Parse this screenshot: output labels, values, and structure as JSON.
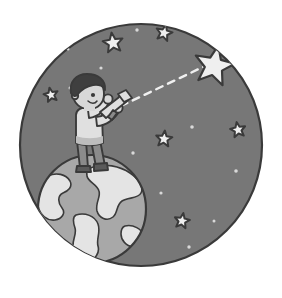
{
  "illustration": {
    "title": "Boy with telescope standing on Earth looking at a star",
    "canvas": {
      "width": 282,
      "height": 298,
      "background": "#ffffff"
    },
    "night_sky": {
      "name": "night-sky-circle",
      "cx": 141,
      "cy": 145,
      "r": 121,
      "fill": "#777777",
      "stroke": "#3a3a3a",
      "stroke_width": 2.2
    },
    "earth": {
      "name": "earth-globe",
      "cx": 92,
      "cy": 209,
      "r": 54,
      "ocean_fill": "#a8a8a8",
      "land_fill": "#e4e4e4",
      "stroke": "#3a3a3a",
      "stroke_width": 2.2
    },
    "sight_line": {
      "name": "telescope-sight-line",
      "x1": 121,
      "y1": 106,
      "x2": 205,
      "y2": 66,
      "color": "#f0f0f0",
      "dash": "7 6",
      "width": 2.4
    },
    "hero_star": {
      "name": "hero-star",
      "cx": 214,
      "cy": 66,
      "r": 21,
      "fill": "#efefef",
      "stroke": "#3a3a3a",
      "stroke_width": 2.2,
      "rotation": 12
    },
    "stars": [
      {
        "name": "star-top-left",
        "cx": 113,
        "cy": 43,
        "r": 10.5,
        "rot": -8
      },
      {
        "name": "star-top-right",
        "cx": 164,
        "cy": 33,
        "r": 8.5,
        "rot": 14
      },
      {
        "name": "star-left",
        "cx": 51,
        "cy": 95,
        "r": 7.5,
        "rot": -12
      },
      {
        "name": "star-center",
        "cx": 164,
        "cy": 139,
        "r": 8.5,
        "rot": 6
      },
      {
        "name": "star-right",
        "cx": 238,
        "cy": 130,
        "r": 8.0,
        "rot": -10
      },
      {
        "name": "star-bottom",
        "cx": 182,
        "cy": 221,
        "r": 8.0,
        "rot": 10
      }
    ],
    "star_style": {
      "fill": "#efefef",
      "stroke": "#3a3a3a",
      "stroke_width": 2.0
    },
    "sparkles": [
      {
        "name": "sparkle-1",
        "cx": 137,
        "cy": 30,
        "r": 1.7
      },
      {
        "name": "sparkle-2",
        "cx": 101,
        "cy": 68,
        "r": 1.6
      },
      {
        "name": "sparkle-3",
        "cx": 70,
        "cy": 88,
        "r": 1.5
      },
      {
        "name": "sparkle-4",
        "cx": 192,
        "cy": 127,
        "r": 1.8
      },
      {
        "name": "sparkle-5",
        "cx": 133,
        "cy": 153,
        "r": 1.7
      },
      {
        "name": "sparkle-6",
        "cx": 236,
        "cy": 171,
        "r": 1.8
      },
      {
        "name": "sparkle-7",
        "cx": 161,
        "cy": 193,
        "r": 1.6
      },
      {
        "name": "sparkle-8",
        "cx": 214,
        "cy": 221,
        "r": 1.5
      },
      {
        "name": "sparkle-9",
        "cx": 189,
        "cy": 247,
        "r": 1.7
      },
      {
        "name": "sparkle-10",
        "cx": 68,
        "cy": 49,
        "r": 1.5
      }
    ],
    "boy": {
      "name": "boy-astronomer",
      "skin_fill": "#d8d8d8",
      "hair_fill": "#3f3f3f",
      "shirt_fill": "#e0e0e0",
      "pants_fill": "#8b8b8b",
      "shoe_fill": "#5a5a5a",
      "outline": "#3a3a3a",
      "outline_width": 1.9
    },
    "telescope": {
      "name": "telescope",
      "body_fill": "#dedede",
      "band_fill": "#8b8b8b",
      "outline": "#3a3a3a",
      "outline_width": 1.9
    }
  }
}
